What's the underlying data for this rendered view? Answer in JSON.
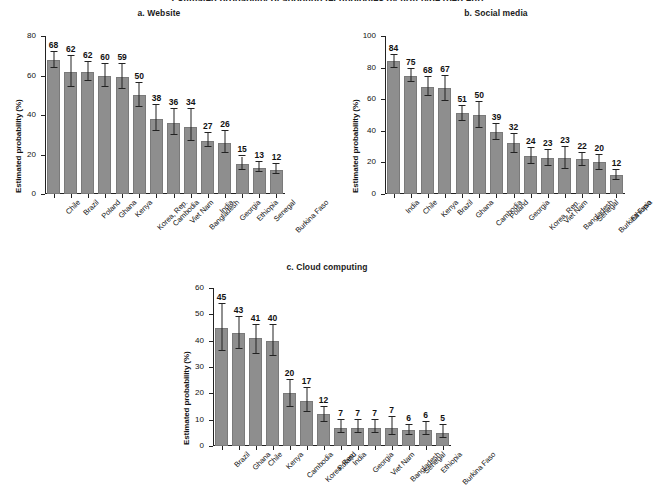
{
  "figure": {
    "supertitle": "Estimated probability of adopting technologies by firm type (percent)",
    "ylabel": "Estimated probability (%)"
  },
  "chart_data": [
    {
      "type": "bar",
      "title": "a. Website",
      "xlabel": "",
      "ylabel": "Estimated probability (%)",
      "ylim": [
        0,
        80
      ],
      "yticks": [
        0,
        20,
        40,
        60,
        80
      ],
      "grid": false,
      "legend": false,
      "categories": [
        "Chile",
        "Brazil",
        "Poland",
        "Ghana",
        "Kenya",
        "Korea, Rep.",
        "Cambodia",
        "Viet Nam",
        "Bangladesh",
        "India",
        "Georgia",
        "Ethiopia",
        "Senegal",
        "Burkina Faso"
      ],
      "values": [
        68,
        62,
        62,
        60,
        59,
        50,
        38,
        36,
        34,
        27,
        26,
        15,
        13,
        12
      ],
      "errors_low": [
        64,
        54,
        57,
        54,
        53,
        44,
        32,
        30,
        27,
        24,
        21,
        12,
        11,
        10
      ],
      "errors_high": [
        72,
        70,
        67,
        66,
        66,
        56,
        45,
        43,
        43,
        31,
        32,
        19,
        16,
        15
      ]
    },
    {
      "type": "bar",
      "title": "b. Social media",
      "xlabel": "",
      "ylabel": "Estimated probability (%)",
      "ylim": [
        0,
        100
      ],
      "yticks": [
        0,
        20,
        40,
        60,
        80,
        100
      ],
      "grid": false,
      "legend": false,
      "categories": [
        "India",
        "Chile",
        "Kenya",
        "Brazil",
        "Ghana",
        "Cambodia",
        "Poland",
        "Georgia",
        "Korea, Rep.",
        "Viet Nam",
        "Bangladesh",
        "Senegal",
        "Burkina Faso",
        "Ethiopia"
      ],
      "values": [
        84,
        75,
        68,
        67,
        51,
        50,
        39,
        32,
        24,
        23,
        23,
        22,
        20,
        12
      ],
      "errors_low": [
        80,
        71,
        62,
        59,
        46,
        42,
        34,
        26,
        19,
        18,
        16,
        18,
        15,
        9
      ],
      "errors_high": [
        88,
        79,
        74,
        75,
        56,
        58,
        44,
        38,
        29,
        28,
        30,
        26,
        25,
        15
      ]
    },
    {
      "type": "bar",
      "title": "c. Cloud computing",
      "xlabel": "",
      "ylabel": "Estimated probability (%)",
      "ylim": [
        0,
        60
      ],
      "yticks": [
        0,
        10,
        20,
        30,
        40,
        50,
        60
      ],
      "grid": false,
      "legend": false,
      "categories": [
        "Brazil",
        "Ghana",
        "Chile",
        "Kenya",
        "Cambodia",
        "Korea, Rep.",
        "Poland",
        "India",
        "Georgia",
        "Viet Nam",
        "Bangladesh",
        "Senegal",
        "Ethiopia",
        "Burkina Faso"
      ],
      "values": [
        45,
        43,
        41,
        40,
        20,
        17,
        12,
        7,
        7,
        7,
        7,
        6,
        6,
        5
      ],
      "errors_low": [
        36,
        37,
        35,
        34,
        15,
        13,
        9,
        5,
        5,
        5,
        4,
        4,
        4,
        3
      ],
      "errors_high": [
        54,
        49,
        46,
        46,
        25,
        22,
        15,
        10,
        10,
        10,
        11,
        8,
        9,
        8
      ]
    }
  ],
  "style": {
    "bar_color": "#8e8e8e",
    "axis_color": "#222222",
    "text_color": "#111111",
    "background": "#ffffff"
  }
}
